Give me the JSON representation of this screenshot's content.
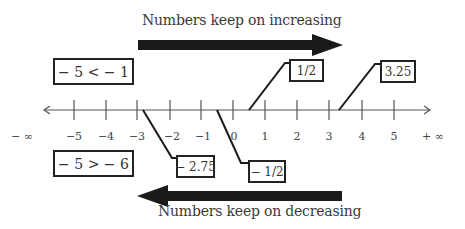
{
  "captions": {
    "top": "Numbers keep on increasing",
    "bottom": "Numbers keep on decreasing"
  },
  "number_line": {
    "ticks": [
      {
        "label": "− ∞",
        "x": 22
      },
      {
        "label": "−5",
        "x": 74
      },
      {
        "label": "−4",
        "x": 106
      },
      {
        "label": "−3",
        "x": 137
      },
      {
        "label": "−2",
        "x": 172
      },
      {
        "label": "−1",
        "x": 203
      },
      {
        "label": "0",
        "x": 234
      },
      {
        "label": "1",
        "x": 265
      },
      {
        "label": "2",
        "x": 297
      },
      {
        "label": "3",
        "x": 329
      },
      {
        "label": "4",
        "x": 362
      },
      {
        "label": "5",
        "x": 394
      },
      {
        "label": "+ ∞",
        "x": 433
      }
    ]
  },
  "comparisons": {
    "less_than": "− 5 < − 1",
    "greater_than": "− 5 > − 6"
  },
  "callouts": {
    "half": "1/2",
    "three_quarter": "3.25",
    "neg_two_seventyfive": "− 2.75",
    "neg_half": "− 1/2"
  },
  "colors": {
    "arrow": "#1a1a1a",
    "line": "#555555",
    "box_border": "#222222"
  }
}
